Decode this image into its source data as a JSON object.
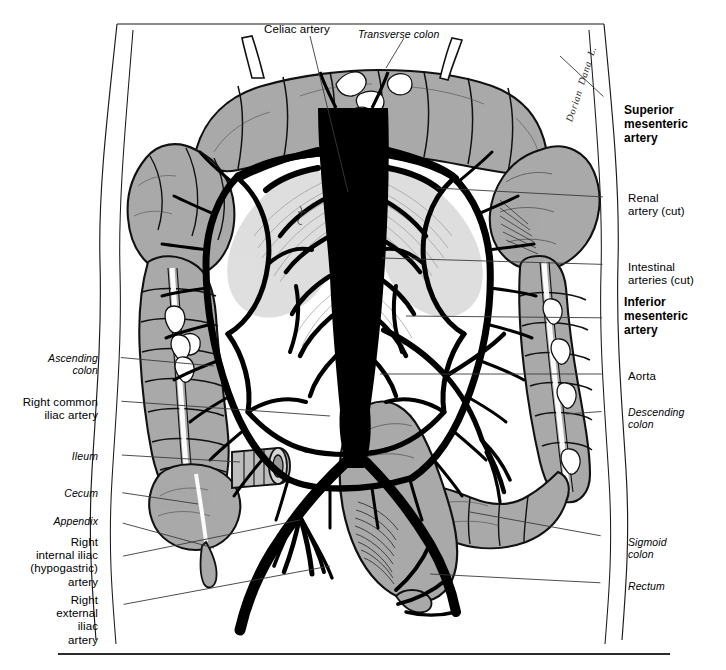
{
  "figure": {
    "colors": {
      "organ_fill": "#a9a9a9",
      "organ_fill_light": "#bdbdbd",
      "vessel": "#000000",
      "outline": "#1a1a1a",
      "background": "#ffffff",
      "leader_line": "#3a3a3a",
      "rule": "#2b2b2b"
    },
    "signature": "Dorian  Dana  L."
  },
  "labels": {
    "top": [
      {
        "id": "celiac-artery",
        "text": "Celiac artery",
        "style": "roman",
        "x": 264,
        "y": 23
      },
      {
        "id": "transverse-colon",
        "text": "Transverse colon",
        "style": "italic",
        "x": 358,
        "y": 28
      }
    ],
    "right": [
      {
        "id": "superior-mesenteric-artery",
        "text": "Superior\nmesenteric\nartery",
        "style": "bold",
        "x": 624,
        "y": 103
      },
      {
        "id": "renal-artery-cut",
        "text": "Renal\nartery (cut)",
        "style": "roman",
        "x": 628,
        "y": 192
      },
      {
        "id": "intestinal-arteries-cut",
        "text": "Intestinal\narteries (cut)",
        "style": "roman",
        "x": 628,
        "y": 261
      },
      {
        "id": "inferior-mesenteric-artery",
        "text": "Inferior\nmesenteric\nartery",
        "style": "bold",
        "x": 624,
        "y": 295
      },
      {
        "id": "aorta",
        "text": "Aorta",
        "style": "roman",
        "x": 628,
        "y": 370
      },
      {
        "id": "descending-colon",
        "text": "Descending\ncolon",
        "style": "italic",
        "x": 628,
        "y": 406
      },
      {
        "id": "sigmoid-colon",
        "text": "Sigmoid\ncolon",
        "style": "italic",
        "x": 628,
        "y": 536
      },
      {
        "id": "rectum",
        "text": "Rectum",
        "style": "italic",
        "x": 628,
        "y": 580
      }
    ],
    "left": [
      {
        "id": "ascending-colon",
        "text": "Ascending\ncolon",
        "style": "italic",
        "x": 98,
        "y": 352,
        "align": "right"
      },
      {
        "id": "right-common-iliac-artery",
        "text": "Right common\niliac artery",
        "style": "roman",
        "x": 98,
        "y": 396,
        "align": "right"
      },
      {
        "id": "ileum",
        "text": "Ileum",
        "style": "italic",
        "x": 98,
        "y": 450,
        "align": "right"
      },
      {
        "id": "cecum",
        "text": "Cecum",
        "style": "italic",
        "x": 98,
        "y": 487,
        "align": "right"
      },
      {
        "id": "appendix",
        "text": "Appendix",
        "style": "italic",
        "x": 98,
        "y": 515,
        "align": "right"
      },
      {
        "id": "right-internal-iliac-artery",
        "text": "Right\ninternal iliac\n(hypogastric)\nartery",
        "style": "roman",
        "x": 98,
        "y": 536,
        "align": "right"
      },
      {
        "id": "right-external-iliac-artery",
        "text": "Right\nexternal\niliac\nartery",
        "style": "roman",
        "x": 98,
        "y": 594,
        "align": "right"
      }
    ]
  },
  "footer": {
    "rule_y": 653
  }
}
